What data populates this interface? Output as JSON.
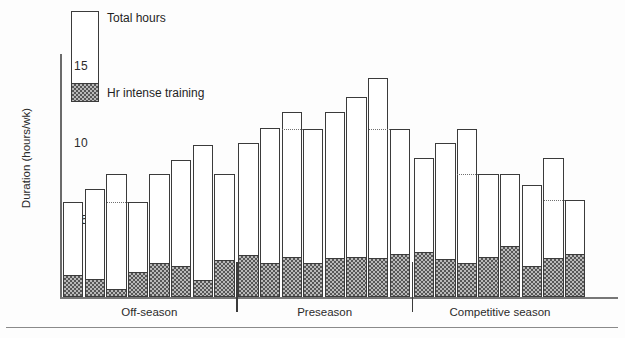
{
  "legend": {
    "total_label": "Total hours",
    "intense_label": "Hr intense training"
  },
  "axis": {
    "y_title": "Duration (hours/wk)",
    "y_ticks": [
      "15",
      "10",
      "5"
    ]
  },
  "seasons": [
    {
      "label": "Off-season"
    },
    {
      "label": "Preseason"
    },
    {
      "label": "Competitive season"
    }
  ],
  "chart_data": {
    "type": "bar",
    "title": "",
    "xlabel": "",
    "ylabel": "Duration (hours/wk)",
    "ylim": [
      0,
      15.5
    ],
    "yticks": [
      5,
      10,
      15
    ],
    "grid": false,
    "legend_position": "top-left",
    "stacked": true,
    "categories": [
      "1",
      "2",
      "3",
      "4",
      "5",
      "6",
      "7",
      "8",
      "9",
      "10",
      "11",
      "12",
      "13",
      "14",
      "15",
      "16",
      "17",
      "18",
      "19",
      "20",
      "21",
      "22",
      "23",
      "24"
    ],
    "season_groups": [
      {
        "name": "Off-season",
        "bars": 8
      },
      {
        "name": "Preseason",
        "bars": 8
      },
      {
        "name": "Competitive season",
        "bars": 8
      }
    ],
    "series": [
      {
        "name": "Total hours",
        "values": [
          6.2,
          7.0,
          8.0,
          6.2,
          8.0,
          8.9,
          9.9,
          8.0,
          10.0,
          11.0,
          12.0,
          10.9,
          12.0,
          13.0,
          14.2,
          10.9,
          9.0,
          10.0,
          10.9,
          8.0,
          8.0,
          7.3,
          9.0,
          6.3
        ]
      },
      {
        "name": "Hr intense training",
        "values": [
          1.4,
          1.2,
          0.5,
          1.6,
          2.2,
          2.0,
          1.1,
          2.4,
          2.7,
          2.2,
          2.6,
          2.2,
          2.5,
          2.6,
          2.5,
          2.8,
          2.9,
          2.5,
          2.2,
          2.6,
          3.3,
          2.0,
          2.5,
          2.8
        ]
      }
    ],
    "dashed_reference_lines": [
      {
        "from_bar": 3,
        "level": 6.2
      },
      {
        "from_bar": 11,
        "level": 10.9
      },
      {
        "from_bar": 15,
        "level": 10.9
      },
      {
        "from_bar": 19,
        "level": 8.0
      },
      {
        "from_bar": 23,
        "level": 6.3
      }
    ]
  }
}
